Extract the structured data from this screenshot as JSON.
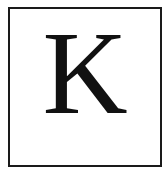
{
  "card": {
    "letter": "K",
    "border_color": "#1a1a1a",
    "text_color": "#111111"
  }
}
